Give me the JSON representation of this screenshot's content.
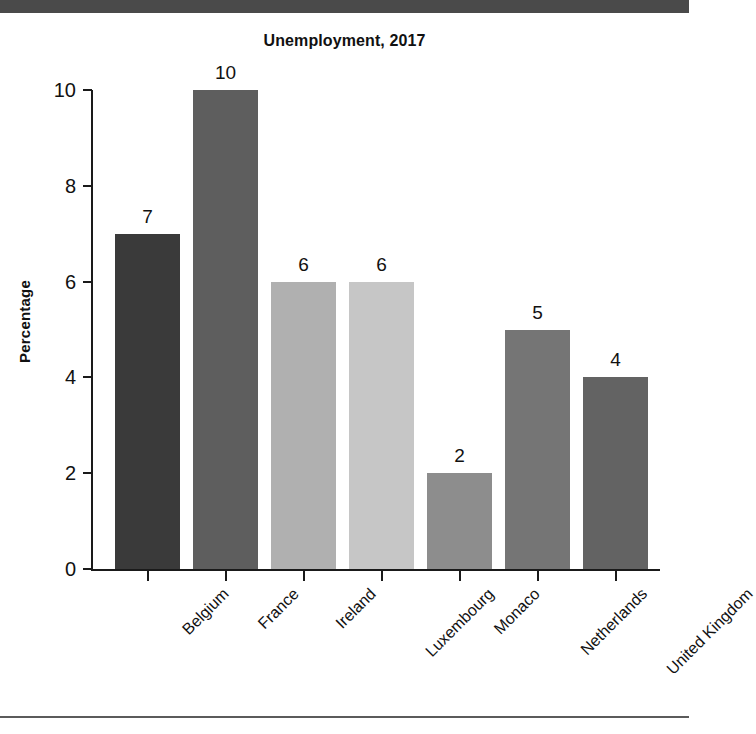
{
  "page": {
    "background_color": "#ffffff",
    "top_band_color": "#4a4a4a",
    "bottom_rule_color": "#5b5b5b"
  },
  "chart_data": {
    "type": "bar",
    "title": "Unemployment, 2017",
    "xlabel": "",
    "ylabel": "Percentage",
    "categories": [
      "Belgium",
      "France",
      "Ireland",
      "Luxembourg",
      "Monaco",
      "Netherlands",
      "United Kingdom"
    ],
    "values": [
      7,
      10,
      6,
      6,
      2,
      5,
      4
    ],
    "value_labels": [
      "7",
      "10",
      "6",
      "6",
      "2",
      "5",
      "4"
    ],
    "bar_colors": [
      "#3a3a3a",
      "#5e5e5e",
      "#b0b0b0",
      "#c6c6c6",
      "#8d8d8d",
      "#757575",
      "#636363"
    ],
    "ylim": [
      0,
      10
    ],
    "ytick_labels": [
      "0",
      "2",
      "4",
      "6",
      "8",
      "10"
    ],
    "ytick_values": [
      0,
      2,
      4,
      6,
      8,
      10
    ],
    "grid": false,
    "legend": "none",
    "xtick_label_rotation": -45
  }
}
